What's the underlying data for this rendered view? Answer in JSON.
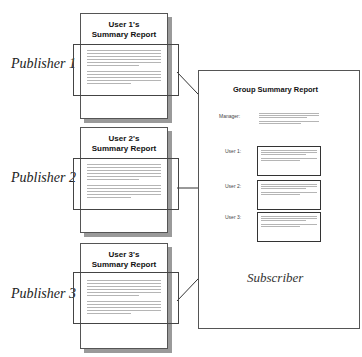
{
  "publishers": [
    {
      "label": "Publisher 1",
      "doc_title_line1": "User 1's",
      "doc_title_line2": "Summary Report"
    },
    {
      "label": "Publisher 2",
      "doc_title_line1": "User 2's",
      "doc_title_line2": "Summary Report"
    },
    {
      "label": "Publisher 3",
      "doc_title_line1": "User 3's",
      "doc_title_line2": "Summary Report"
    }
  ],
  "subscriber": {
    "label": "Subscriber",
    "doc_title": "Group Summary Report",
    "rows": [
      {
        "label": "Manager:"
      },
      {
        "label": "User 1:"
      },
      {
        "label": "User 2:"
      },
      {
        "label": "User 3:"
      }
    ]
  },
  "colors": {
    "line": "#333333",
    "shadow": "#9a9a9a",
    "placeholder_text": "#b5b5b5"
  }
}
